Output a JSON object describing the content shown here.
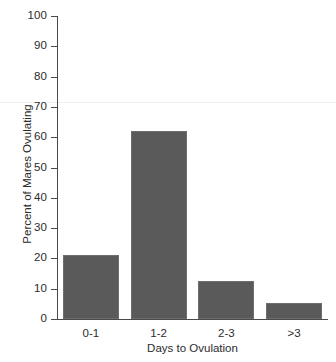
{
  "chart_data": {
    "type": "bar",
    "title": "",
    "xlabel": "Days to Ovulation",
    "ylabel": "Percent of Mares Ovulating",
    "categories": [
      "0-1",
      "1-2",
      "2-3",
      ">3"
    ],
    "values": [
      21,
      62,
      12.5,
      5.3
    ],
    "ylim": [
      0,
      100
    ],
    "ytick_labels": [
      "0",
      "10",
      "20",
      "30",
      "40",
      "50",
      "60",
      "70",
      "80",
      "90",
      "100"
    ],
    "ytick_values": [
      0,
      10,
      20,
      30,
      40,
      50,
      60,
      70,
      80,
      90,
      100
    ],
    "grid": false,
    "legend": null,
    "bar_color": "#5a5a5a",
    "axis_color": "#4a4a4a",
    "background": "#ffffff"
  }
}
